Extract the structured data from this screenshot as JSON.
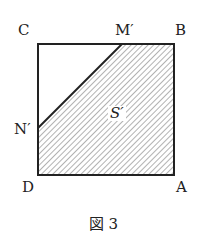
{
  "figure": {
    "vertices": {
      "C": "C",
      "B": "B",
      "D": "D",
      "A": "A"
    },
    "points": {
      "M": "M′",
      "N": "N′"
    },
    "region_label": "S′",
    "caption": "図 3"
  },
  "geometry": {
    "square": {
      "x": 38,
      "y": 44,
      "size": 136
    },
    "M_x": 122,
    "N_y": 128,
    "line_color": "#222222",
    "hatch_color": "#555555"
  }
}
